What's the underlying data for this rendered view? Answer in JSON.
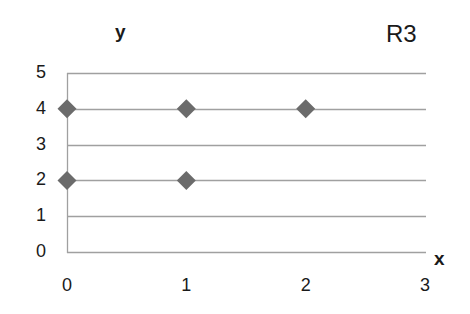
{
  "chart_data": {
    "type": "scatter",
    "title": "R3",
    "xlabel": "x",
    "ylabel": "y",
    "xlim": [
      0,
      3
    ],
    "ylim": [
      0,
      5
    ],
    "x_ticks": [
      "0",
      "1",
      "2",
      "3"
    ],
    "y_ticks": [
      "0",
      "1",
      "2",
      "3",
      "4",
      "5"
    ],
    "grid": "horizontal",
    "legend": null,
    "series": [
      {
        "name": "R3",
        "marker": "diamond",
        "color": "#6b6b6b",
        "points": [
          {
            "x": 0,
            "y": 4
          },
          {
            "x": 1,
            "y": 4
          },
          {
            "x": 2,
            "y": 4
          },
          {
            "x": 0,
            "y": 2
          },
          {
            "x": 1,
            "y": 2
          }
        ]
      }
    ]
  },
  "colors": {
    "grid": "#a0a0a0",
    "marker": "#6b6b6b",
    "text": "#1a1a1a"
  }
}
